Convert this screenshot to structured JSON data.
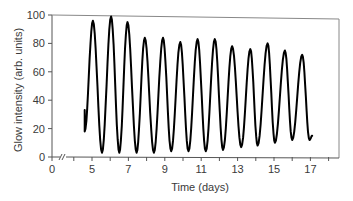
{
  "chart_data": {
    "type": "line",
    "title": "",
    "xlabel": "Time (days)",
    "ylabel": "Glow intensity (arb. units)",
    "xlim": [
      0,
      18
    ],
    "ylim": [
      0,
      100
    ],
    "x_axis_break": true,
    "grid": false,
    "legend": null,
    "x_tick_labels": [
      "0",
      "5",
      "7",
      "9",
      "11",
      "13",
      "15",
      "17"
    ],
    "x_tick_label_values": [
      0,
      5,
      7,
      9,
      11,
      13,
      15,
      17
    ],
    "x_minor_ticks": [
      4,
      5,
      6,
      7,
      8,
      9,
      10,
      11,
      12,
      13,
      14,
      15,
      16,
      17,
      18
    ],
    "y_tick_labels": [
      "0",
      "20",
      "40",
      "60",
      "80",
      "100"
    ],
    "y_tick_values": [
      0,
      20,
      40,
      60,
      80,
      100
    ],
    "series": [
      {
        "name": "Glow intensity",
        "color": "#000000",
        "peaks": [
          {
            "x": 5.05,
            "y": 96
          },
          {
            "x": 6.05,
            "y": 99
          },
          {
            "x": 6.95,
            "y": 95
          },
          {
            "x": 7.9,
            "y": 84
          },
          {
            "x": 8.9,
            "y": 84
          },
          {
            "x": 9.85,
            "y": 81
          },
          {
            "x": 10.8,
            "y": 83
          },
          {
            "x": 11.75,
            "y": 83
          },
          {
            "x": 12.7,
            "y": 78
          },
          {
            "x": 13.7,
            "y": 76
          },
          {
            "x": 14.65,
            "y": 80
          },
          {
            "x": 15.6,
            "y": 75
          },
          {
            "x": 16.55,
            "y": 72
          }
        ],
        "troughs": [
          {
            "x": 5.55,
            "y": 3
          },
          {
            "x": 6.5,
            "y": 3
          },
          {
            "x": 7.45,
            "y": 3
          },
          {
            "x": 8.4,
            "y": 3
          },
          {
            "x": 9.35,
            "y": 4
          },
          {
            "x": 10.3,
            "y": 4
          },
          {
            "x": 11.25,
            "y": 4
          },
          {
            "x": 12.2,
            "y": 5
          },
          {
            "x": 13.2,
            "y": 7
          },
          {
            "x": 14.1,
            "y": 8
          },
          {
            "x": 15.05,
            "y": 10
          },
          {
            "x": 16.0,
            "y": 12
          },
          {
            "x": 16.95,
            "y": 12
          }
        ],
        "start": [
          {
            "x": 4.6,
            "y": 33
          },
          {
            "x": 4.6,
            "y": 18
          }
        ],
        "end": {
          "x": 17.1,
          "y": 15
        }
      }
    ]
  }
}
